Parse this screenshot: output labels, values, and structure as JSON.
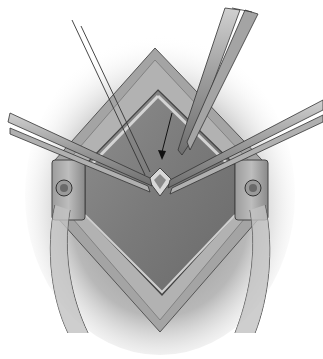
{
  "figure": {
    "type": "surgical-illustration",
    "style": "grayscale",
    "elements": [
      "incision-wound",
      "left-retractor",
      "right-retractor",
      "left-forceps",
      "right-forceps",
      "scissors",
      "suture-needle-lines",
      "pointer-arrow",
      "tissue-flap"
    ]
  },
  "colors": {
    "background": "#ffffff",
    "skin_shadow": "#9a9a9a",
    "wound_edge": "#8c8c8c",
    "wound_bed": "#7a7a7a",
    "instrument": "#a8a8a8",
    "outline": "#3a3a3a",
    "arrow": "#111111"
  }
}
